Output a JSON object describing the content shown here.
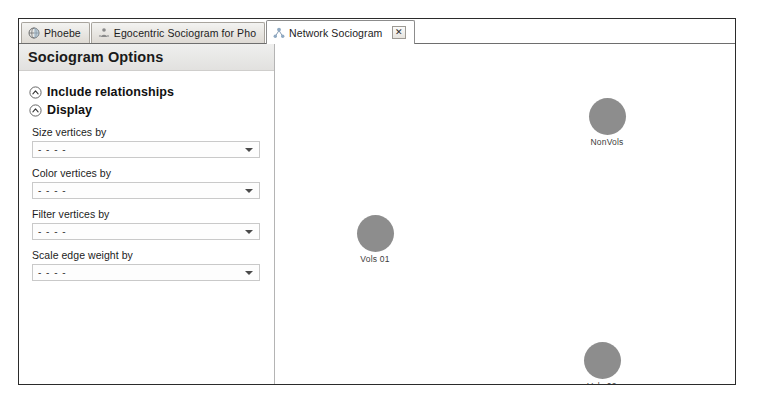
{
  "window": {
    "tabs": [
      {
        "label": "Phoebe",
        "icon": "globe-icon",
        "active": false,
        "closable": false
      },
      {
        "label": "Egocentric Sociogram for Pho",
        "icon": "person-network-icon",
        "active": false,
        "closable": false
      },
      {
        "label": "Network Sociogram",
        "icon": "network-icon",
        "active": true,
        "closable": true,
        "close_label": "✕"
      }
    ]
  },
  "sidebar": {
    "title": "Sociogram Options",
    "sections": [
      {
        "label": "Include relationships",
        "icon": "chevron-up-circle-icon",
        "expanded": false
      },
      {
        "label": "Display",
        "icon": "chevron-up-circle-icon",
        "expanded": true
      }
    ],
    "fields": [
      {
        "label": "Size vertices by",
        "value": "- - - -"
      },
      {
        "label": "Color vertices by",
        "value": "- - - -"
      },
      {
        "label": "Filter vertices by",
        "value": "- - - -"
      },
      {
        "label": "Scale edge weight by",
        "value": "- - - -"
      }
    ]
  },
  "canvas": {
    "node_color": "#8d8d8d",
    "nodes": [
      {
        "label": "NonVols",
        "x": 332,
        "y": 54,
        "size": 37
      },
      {
        "label": "Vols 01",
        "x": 100,
        "y": 171,
        "size": 37
      },
      {
        "label": "Vols 02",
        "x": 327,
        "y": 298,
        "size": 37
      }
    ]
  }
}
